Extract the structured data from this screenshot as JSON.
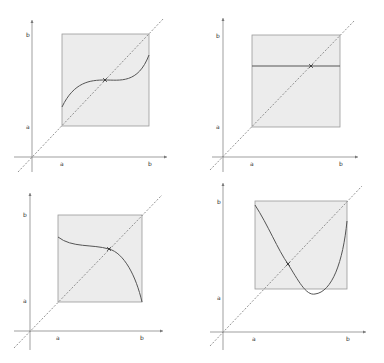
{
  "figure": {
    "colors": {
      "background": "#ffffff",
      "square_fill": "#ececec",
      "square_stroke": "#9a9a9a",
      "axis": "#777777",
      "diagonal": "#777777",
      "curve": "#555555",
      "fixed_point_marker": "#333333"
    },
    "axis_labels": {
      "a": "a",
      "b": "b"
    },
    "panels": [
      {
        "id": "top-left",
        "shape": "cubic-s-curve",
        "origin": [
          32,
          157
        ],
        "y_axis_top": 20,
        "y_axis_bottom": 172,
        "x_axis_left": 14,
        "x_axis_right": 167,
        "square": {
          "x": 62,
          "y": 34,
          "w": 87,
          "h": 92
        },
        "diag": {
          "x1": 18,
          "y1": 172,
          "x2": 164,
          "y2": 18
        },
        "curve_path": "M62,107 C74,82 90,80 105,80 C120,80 138,84 149,55",
        "fixed_point": [
          105,
          80
        ],
        "labels": {
          "ya": [
            26,
            129
          ],
          "yb": [
            26,
            37
          ],
          "xa": [
            60,
            166
          ],
          "xb": [
            148,
            166
          ]
        }
      },
      {
        "id": "top-right",
        "shape": "constant-line",
        "origin": [
          223,
          157
        ],
        "y_axis_top": 18,
        "y_axis_bottom": 172,
        "x_axis_left": 212,
        "x_axis_right": 358,
        "square": {
          "x": 252,
          "y": 35,
          "w": 88,
          "h": 92
        },
        "diag": {
          "x1": 210,
          "y1": 170,
          "x2": 355,
          "y2": 20
        },
        "curve_path": "M252,66 L340,66",
        "fixed_point": [
          311,
          66
        ],
        "labels": {
          "ya": [
            216,
            129
          ],
          "yb": [
            216,
            38
          ],
          "xa": [
            250,
            166
          ],
          "xb": [
            339,
            166
          ]
        }
      },
      {
        "id": "bottom-left",
        "shape": "decreasing-cubic",
        "origin": [
          30,
          331
        ],
        "y_axis_top": 193,
        "y_axis_bottom": 350,
        "x_axis_left": 14,
        "x_axis_right": 163,
        "square": {
          "x": 58,
          "y": 215,
          "w": 84,
          "h": 87
        },
        "diag": {
          "x1": 14,
          "y1": 348,
          "x2": 162,
          "y2": 195
        },
        "curve_path": "M58,237 C72,248 92,244 109,249 C124,253 136,276 142,302",
        "fixed_point": [
          109,
          249
        ],
        "labels": {
          "ya": [
            23,
            303
          ],
          "yb": [
            23,
            217
          ],
          "xa": [
            56,
            340
          ],
          "xb": [
            140,
            340
          ]
        }
      },
      {
        "id": "bottom-right",
        "shape": "u-shaped-parabola",
        "origin": [
          223,
          332
        ],
        "y_axis_top": 183,
        "y_axis_bottom": 350,
        "x_axis_left": 210,
        "x_axis_right": 366,
        "square": {
          "x": 255,
          "y": 201,
          "w": 92,
          "h": 88
        },
        "diag": {
          "x1": 210,
          "y1": 346,
          "x2": 362,
          "y2": 186
        },
        "curve_path": "M255,205 C268,225 278,250 288,264 C298,280 306,296 315,294 C332,292 343,262 347,221",
        "fixed_point": [
          288,
          264
        ],
        "labels": {
          "ya": [
            217,
            300
          ],
          "yb": [
            217,
            204
          ],
          "xa": [
            252,
            341
          ],
          "xb": [
            346,
            341
          ]
        }
      }
    ]
  }
}
